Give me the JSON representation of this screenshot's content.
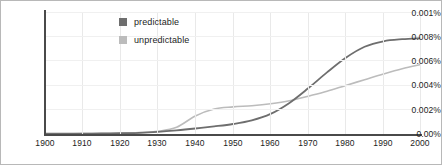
{
  "chart_data": {
    "type": "line",
    "title": "",
    "xlabel": "",
    "ylabel": "",
    "xlim": [
      1900,
      2000
    ],
    "ylim": [
      0,
      0.01
    ],
    "grid": true,
    "legend_position": "top-left-inside",
    "xticks": [
      "1900",
      "1910",
      "1920",
      "1930",
      "1940",
      "1950",
      "1960",
      "1970",
      "1980",
      "1990",
      "2000"
    ],
    "yticks": [
      "0.00%",
      "0.002%",
      "0.004%",
      "0.006%",
      "0.008%",
      "0.001%"
    ],
    "ytick_values": [
      0,
      0.002,
      0.004,
      0.006,
      0.008,
      0.01
    ],
    "x": [
      1900,
      1905,
      1910,
      1915,
      1920,
      1925,
      1930,
      1935,
      1940,
      1945,
      1950,
      1955,
      1960,
      1965,
      1970,
      1975,
      1980,
      1985,
      1990,
      1995,
      2000
    ],
    "series": [
      {
        "name": "predictable",
        "color": "#6e6e6e",
        "values": [
          2e-05,
          2e-05,
          3e-05,
          4e-05,
          6e-05,
          0.0001,
          0.00018,
          0.0003,
          0.00045,
          0.00062,
          0.00082,
          0.00112,
          0.00165,
          0.00255,
          0.00375,
          0.00505,
          0.00625,
          0.00715,
          0.0076,
          0.00777,
          0.00785
        ]
      },
      {
        "name": "unpredictable",
        "color": "#bcbcbc",
        "values": [
          2e-05,
          2e-05,
          3e-05,
          4e-05,
          6e-05,
          0.00011,
          0.00022,
          0.00055,
          0.00148,
          0.00205,
          0.00222,
          0.00232,
          0.00248,
          0.00272,
          0.0031,
          0.0035,
          0.00398,
          0.00445,
          0.00492,
          0.00535,
          0.0057
        ]
      }
    ]
  },
  "legend": {
    "items": [
      {
        "label": "predictable",
        "color": "#6e6e6e"
      },
      {
        "label": "unpredictable",
        "color": "#bcbcbc"
      }
    ]
  },
  "axes": {
    "y_labels": [
      "0.001%",
      "0.008%",
      "0.006%",
      "0.004%",
      "0.002%",
      "0.00%"
    ],
    "x_labels": [
      "1900",
      "1910",
      "1920",
      "1930",
      "1940",
      "1950",
      "1960",
      "1970",
      "1980",
      "1990",
      "2000"
    ]
  }
}
